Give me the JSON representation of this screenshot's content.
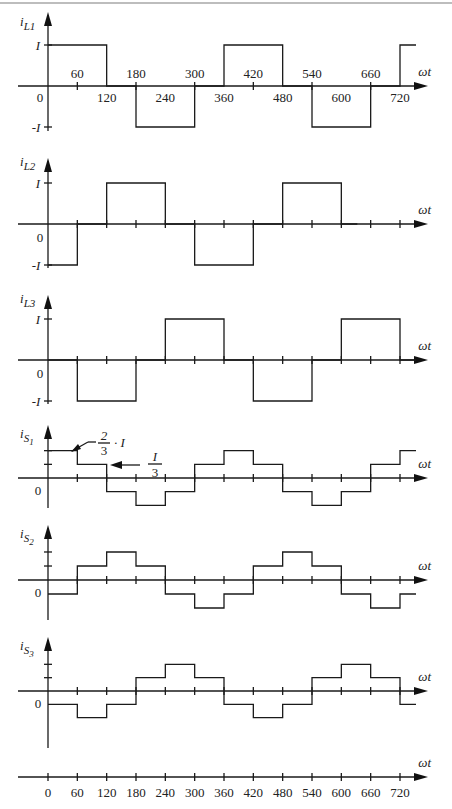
{
  "chart_data": [
    {
      "type": "line",
      "name": "iL1",
      "ylabel": "i_L1",
      "xlabel": "ωt",
      "y_ticks": [
        "I",
        "-I"
      ],
      "x_tick_labels": [
        "0",
        "60",
        "120",
        "180",
        "240",
        "300",
        "360",
        "420",
        "480",
        "540",
        "600",
        "660",
        "720"
      ],
      "x": [
        0,
        120,
        180,
        300,
        360,
        480,
        540,
        660,
        720
      ],
      "values": [
        1,
        0,
        -1,
        0,
        1,
        0,
        -1,
        0,
        1
      ],
      "step": "post"
    },
    {
      "type": "line",
      "name": "iL2",
      "ylabel": "i_L2",
      "xlabel": "ωt",
      "y_ticks": [
        "I",
        "0",
        "-I"
      ],
      "x": [
        0,
        60,
        120,
        240,
        300,
        420,
        480,
        600
      ],
      "values": [
        -1,
        0,
        1,
        0,
        -1,
        0,
        1,
        0
      ],
      "step": "post"
    },
    {
      "type": "line",
      "name": "iL3",
      "ylabel": "i_L3",
      "xlabel": "ωt",
      "y_ticks": [
        "I",
        "0",
        "-I"
      ],
      "x": [
        0,
        60,
        180,
        240,
        360,
        420,
        540,
        600,
        720
      ],
      "values": [
        0,
        -1,
        0,
        1,
        0,
        -1,
        0,
        1,
        0
      ],
      "step": "post"
    },
    {
      "type": "line",
      "name": "iS1",
      "ylabel": "i_S1",
      "xlabel": "ωt",
      "annotations": [
        "2/3 · I",
        "I/3"
      ],
      "x": [
        0,
        60,
        120,
        180,
        240,
        300,
        360,
        420,
        480,
        540,
        600,
        660,
        720
      ],
      "values": [
        0.667,
        0.333,
        -0.333,
        -0.667,
        -0.333,
        0.333,
        0.667,
        0.333,
        -0.333,
        -0.667,
        -0.333,
        0.333,
        0.667
      ],
      "step": "post"
    },
    {
      "type": "line",
      "name": "iS2",
      "ylabel": "i_S2",
      "xlabel": "ωt",
      "x": [
        0,
        60,
        120,
        180,
        240,
        300,
        360,
        420,
        480,
        540,
        600,
        660,
        720
      ],
      "values": [
        -0.333,
        0.333,
        0.667,
        0.333,
        -0.333,
        -0.667,
        -0.333,
        0.333,
        0.667,
        0.333,
        -0.333,
        -0.667,
        -0.333
      ],
      "step": "post"
    },
    {
      "type": "line",
      "name": "iS3",
      "ylabel": "i_S3",
      "xlabel": "ωt",
      "x": [
        0,
        60,
        120,
        180,
        240,
        300,
        360,
        420,
        480,
        540,
        600,
        660,
        720
      ],
      "values": [
        -0.333,
        -0.667,
        -0.333,
        0.333,
        0.667,
        0.333,
        -0.333,
        -0.667,
        -0.333,
        0.333,
        0.667,
        0.333,
        -0.333
      ],
      "step": "post"
    },
    {
      "type": "axis",
      "name": "angle-axis",
      "xlabel": "ωt",
      "x_tick_labels": [
        "0",
        "60",
        "120",
        "180",
        "240",
        "300",
        "360",
        "420",
        "480",
        "540",
        "600",
        "660",
        "720"
      ]
    }
  ],
  "labels": {
    "iL1": "i",
    "iL1_sub": "L1",
    "iL2": "i",
    "iL2_sub": "L2",
    "iL3": "i",
    "iL3_sub": "L3",
    "iS1": "i",
    "iS1_sub": "S",
    "iS1_subsub": "1",
    "iS2": "i",
    "iS2_sub": "S",
    "iS2_subsub": "2",
    "iS3": "i",
    "iS3_sub": "S",
    "iS3_subsub": "3",
    "omega_t": "ωt",
    "I": "I",
    "neg_I": "-I",
    "zero": "0",
    "two_thirds_num": "2",
    "two_thirds_den": "3",
    "two_thirds_suffix": "· I",
    "third_num": "I",
    "third_den": "3",
    "ticks": [
      "0",
      "60",
      "120",
      "180",
      "240",
      "300",
      "360",
      "420",
      "480",
      "540",
      "600",
      "660",
      "720"
    ]
  }
}
